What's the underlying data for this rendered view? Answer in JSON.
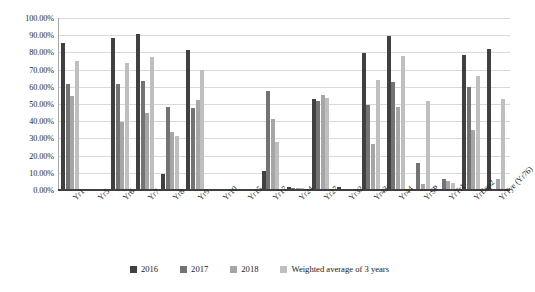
{
  "chart_data": {
    "type": "bar",
    "title": "",
    "xlabel": "",
    "ylabel": "",
    "ylim": [
      0,
      100
    ],
    "ytick_labels": [
      "100.00%",
      "90.00%",
      "80.00%",
      "70.00%",
      "60.00%",
      "50.00%",
      "40.00%",
      "30.00%",
      "20.00%",
      "10.00%",
      "0.00%"
    ],
    "ytick_values": [
      100,
      90,
      80,
      70,
      60,
      50,
      40,
      30,
      20,
      10,
      0
    ],
    "grid": "horizontal",
    "legend_position": "bottom-center",
    "categories": [
      "Yr1",
      "Yr5",
      "Yr6",
      "Yr7",
      "Yr8",
      "Yr9",
      "Yr10",
      "Yr15",
      "Yr17",
      "Yr24",
      "Yr27",
      "Yr32",
      "Yr43",
      "Yr44",
      "YrSP",
      "YrTr1",
      "YrExp2",
      "YrTye (Yr76)"
    ],
    "series": [
      {
        "name": "2016",
        "color": "#404040",
        "values": [
          85.7,
          0,
          88.5,
          90.8,
          9.5,
          81.5,
          0,
          0,
          10.8,
          2.0,
          53.0,
          1.8,
          79.8,
          89.6,
          0,
          0,
          78.5,
          82.0
        ]
      },
      {
        "name": "2017",
        "color": "#737373",
        "values": [
          61.5,
          0,
          61.8,
          63.3,
          48.0,
          47.5,
          0,
          0,
          57.8,
          1.2,
          52.0,
          0,
          49.5,
          62.8,
          15.5,
          6.5,
          59.8,
          0
        ]
      },
      {
        "name": "2018",
        "color": "#a6a6a6",
        "values": [
          54.5,
          0,
          39.5,
          44.5,
          33.5,
          52.2,
          0,
          0,
          41.0,
          1.0,
          55.0,
          0,
          27.0,
          48.5,
          3.5,
          5.0,
          35.0,
          6.5
        ]
      },
      {
        "name": "Weighted average of 3 years",
        "color": "#bfbfbf",
        "values": [
          75.2,
          0,
          73.8,
          77.2,
          31.5,
          70.0,
          0,
          0,
          28.2,
          1.4,
          53.5,
          0,
          64.2,
          78.0,
          51.5,
          4.0,
          66.5,
          53.0
        ]
      }
    ]
  },
  "legend": {
    "items": [
      {
        "label": "2016",
        "color": "#404040"
      },
      {
        "label": "2017",
        "color": "#737373"
      },
      {
        "label": "2018",
        "color": "#a6a6a6"
      },
      {
        "label": "Weighted average of 3 years",
        "color": "#bfbfbf"
      }
    ]
  }
}
